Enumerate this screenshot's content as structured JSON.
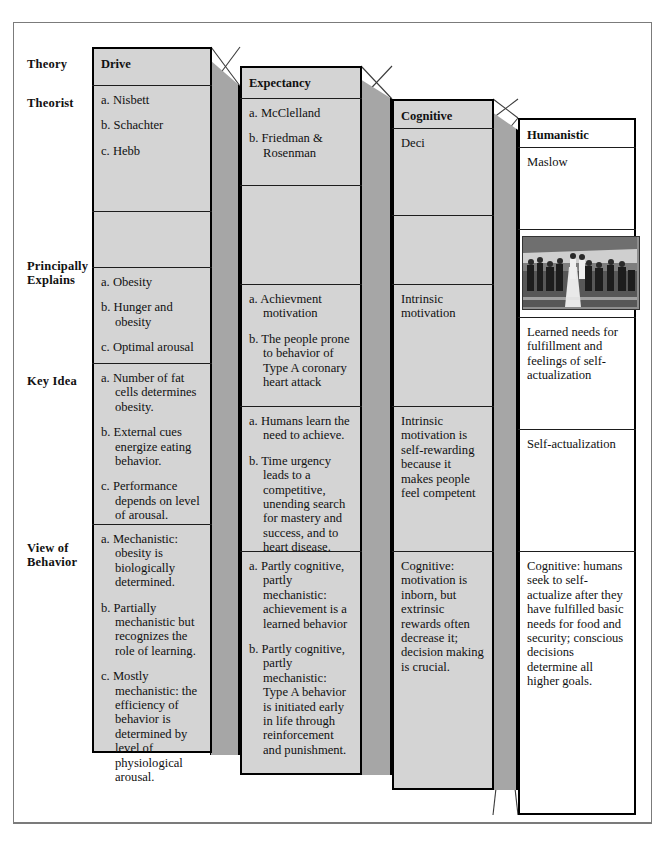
{
  "figure": {
    "type": "comparison-table-3d",
    "row_labels": [
      {
        "id": "theory",
        "text": "Theory"
      },
      {
        "id": "theorist",
        "text": "Theorist"
      },
      {
        "id": "principally-explains",
        "line1": "Principally",
        "line2": "Explains"
      },
      {
        "id": "key-idea",
        "text": "Key Idea"
      },
      {
        "id": "view-of-behavior",
        "line1": "View of",
        "line2": "Behavior"
      }
    ],
    "colors": {
      "card_shaded": "#d4d4d4",
      "card_plain": "#ffffff",
      "side_face": "#a6a6a6",
      "outline": "#000000",
      "frame": "#7b7b7b"
    },
    "columns": [
      {
        "id": "drive",
        "title": "Drive",
        "theorist": [
          "a. Nisbett",
          "b. Schachter",
          "c. Hebb"
        ],
        "principally_explains": [
          "a. Obesity",
          "b. Hunger and obesity",
          "c. Optimal arousal"
        ],
        "key_idea": [
          "a. Number of fat cells determines obesity.",
          "b. External cues energize eating behavior.",
          "c. Performance depends on level of arousal."
        ],
        "view_of_behavior": [
          "a. Mechanistic: obesity is biologically determined.",
          "b. Partially mechanistic but recognizes the role of learning.",
          "c. Mostly mechanistic: the efficiency of behavior is determined by level of physiological arousal."
        ]
      },
      {
        "id": "expectancy",
        "title": "Expectancy",
        "theorist": [
          "a. McClelland",
          "b. Friedman & Rosenman"
        ],
        "principally_explains": [
          "a. Achievment motivation",
          "b. The people prone to behavior of Type A coronary heart attack"
        ],
        "key_idea": [
          "a. Humans learn the need to achieve.",
          "b. Time urgency leads to a competitive, unending search for mastery and success, and to heart disease."
        ],
        "view_of_behavior": [
          "a. Partly cognitive, partly mechanistic: achievement is a learned behavior",
          "b. Partly cognitive, partly mechanistic: Type A behavior is initiated early in life through reinforcement and punishment."
        ]
      },
      {
        "id": "cognitive",
        "title": "Cognitive",
        "theorist": [
          "Deci"
        ],
        "principally_explains": [
          "Intrinsic motivation"
        ],
        "key_idea": [
          "Intrinsic motivation is self-rewarding because it makes people feel competent"
        ],
        "view_of_behavior": [
          "Cognitive: motivation is inborn, but extrinsic rewards often decrease it; decision making is crucial."
        ]
      },
      {
        "id": "humanistic",
        "title": "Humanistic",
        "theorist": [
          "Maslow"
        ],
        "photo_caption": "photo-runners-marathon",
        "principally_explains": [
          "Learned needs for fulfillment and feelings of self-actualization"
        ],
        "key_idea": [
          "Self-actualization"
        ],
        "view_of_behavior": [
          "Cognitive: humans seek to self-actualize after they have fulfilled basic needs for food and security; conscious decisions determine all higher goals."
        ]
      }
    ]
  }
}
